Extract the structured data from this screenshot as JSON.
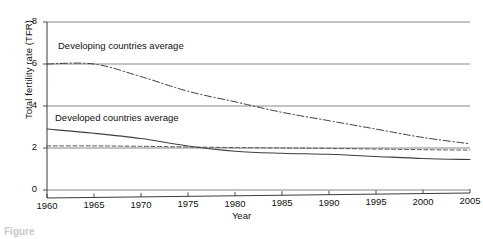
{
  "figure": {
    "caption_fragment": "Figure",
    "background_color": "#ffffff",
    "ink_color": "#333333"
  },
  "axes": {
    "y_title": "Total fertility rate (TFR)",
    "x_title": "Year",
    "y_ticks": [
      0,
      2,
      4,
      6,
      8
    ],
    "y_tick_labels": [
      "0",
      "2",
      "4",
      "6",
      "8"
    ],
    "x_ticks": [
      1960,
      1965,
      1970,
      1975,
      1980,
      1985,
      1990,
      1995,
      2000,
      2005
    ],
    "x_tick_labels": [
      "1960",
      "1965",
      "1970",
      "1975",
      "1980",
      "1985",
      "1990",
      "1995",
      "2000",
      "2005"
    ],
    "grid": "horizontal",
    "ylim": [
      0,
      8
    ],
    "xlim": [
      1960,
      2005
    ]
  },
  "annotations": {
    "developing_label": "Developing countries average",
    "developed_label": "Developed countries average"
  },
  "chart_data": {
    "type": "line",
    "title": "",
    "xlabel": "Year",
    "ylabel": "Total fertility rate (TFR)",
    "xlim": [
      1960,
      2005
    ],
    "ylim": [
      0,
      8
    ],
    "grid": true,
    "legend": "inline-annotations",
    "x": [
      1960,
      1965,
      1970,
      1975,
      1980,
      1985,
      1990,
      1995,
      2000,
      2005
    ],
    "series": [
      {
        "name": "Developing countries average",
        "style": "dash-dot",
        "color": "#3f3f3f",
        "values": [
          6.0,
          6.0,
          5.4,
          4.7,
          4.2,
          3.7,
          3.3,
          2.9,
          2.5,
          2.2
        ]
      },
      {
        "name": "Developed countries average",
        "style": "solid",
        "color": "#3f3f3f",
        "values": [
          2.9,
          2.7,
          2.45,
          2.1,
          1.85,
          1.75,
          1.7,
          1.6,
          1.5,
          1.45
        ]
      },
      {
        "name": "Replacement level reference",
        "style": "dashed",
        "color": "#555555",
        "values": [
          2.1,
          2.1,
          2.08,
          2.05,
          2.02,
          2.0,
          1.98,
          1.95,
          1.92,
          1.9
        ]
      }
    ]
  }
}
